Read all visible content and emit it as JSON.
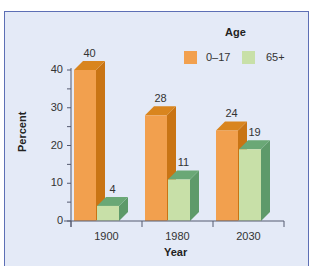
{
  "chart_data": {
    "type": "bar",
    "title": "",
    "xlabel": "Year",
    "ylabel": "Percent",
    "categories": [
      "1900",
      "1980",
      "2030"
    ],
    "series": [
      {
        "name": "0–17",
        "values": [
          40,
          28,
          24
        ],
        "color": "#f2a04e",
        "side_color": "#c97414",
        "top_color": "#d9851e"
      },
      {
        "name": "65+",
        "values": [
          4,
          11,
          19
        ],
        "color": "#c8e0a8",
        "side_color": "#5e9a6a",
        "top_color": "#6aa876"
      }
    ],
    "legend": {
      "title": "Age",
      "position": "top-right"
    },
    "ylim": [
      0,
      40
    ],
    "yticks": [
      "0",
      "10",
      "20",
      "30",
      "40"
    ],
    "grid": false,
    "style": "3d-bar"
  },
  "colors": {
    "background": "#e4eaf7",
    "border": "#5d6fb5"
  }
}
